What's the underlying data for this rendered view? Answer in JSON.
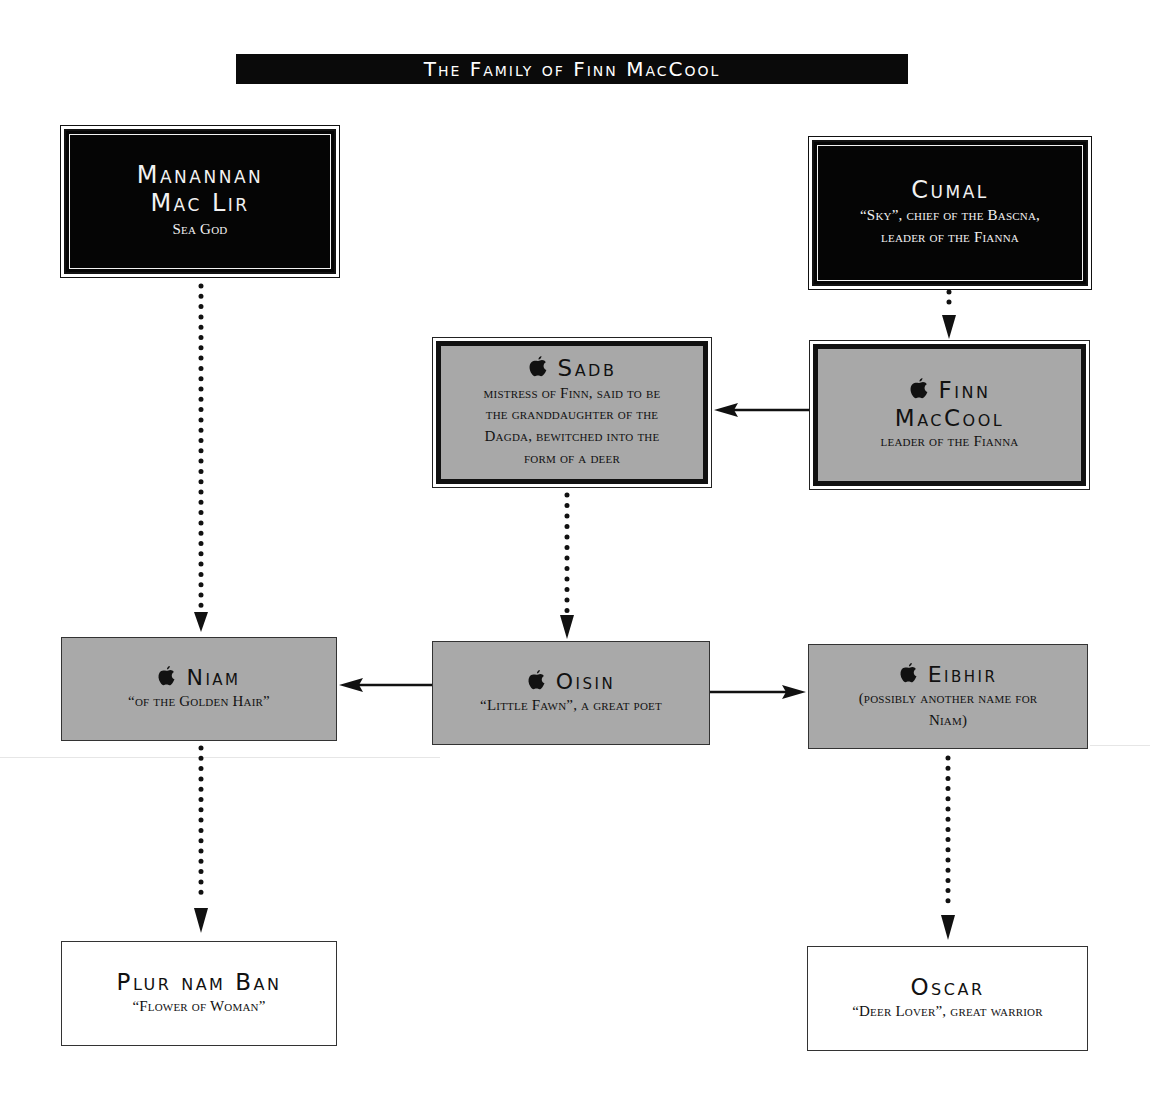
{
  "title": "The Family of Finn MacCool",
  "legend": {
    "divine_icon": "apple-icon",
    "arrow_types": [
      "dotted-arrow: descent",
      "solid-arrow: relationship"
    ]
  },
  "nodes": {
    "manannan": {
      "name_line1": "Manannan",
      "name_line2": "Mac Lir",
      "desc": "Sea God",
      "style": "black"
    },
    "cumal": {
      "name": "Cumal",
      "desc_line1": "“Sky”, chief of the Bascna,",
      "desc_line2": "leader of the Fianna",
      "style": "black"
    },
    "sadb": {
      "icon": "",
      "name": "Sadb",
      "desc_line1": "mistress of Finn, said to be",
      "desc_line2": "the granddaughter of the",
      "desc_line3": "Dagda, bewitched into the",
      "desc_line4": "form of a deer",
      "style": "grey-heavy"
    },
    "finn": {
      "icon": "",
      "name_line1": "Finn",
      "name_line2": "MacCool",
      "desc": "leader of the Fianna",
      "style": "grey-heavy"
    },
    "niam": {
      "icon": "",
      "name": "Niam",
      "desc": "“of the Golden Hair”",
      "style": "grey"
    },
    "oisin": {
      "icon": "",
      "name": "Oisin",
      "desc": "“Little Fawn”, a great poet",
      "style": "grey"
    },
    "eibhir": {
      "icon": "",
      "name": "Eibhir",
      "desc_line1": "(possibly another name for",
      "desc_line2": "Niam)",
      "style": "grey"
    },
    "plur": {
      "name": "Plur nam Ban",
      "desc": "“Flower of Woman”",
      "style": "white"
    },
    "oscar": {
      "name": "Oscar",
      "desc": "“Deer Lover”, great warrior",
      "style": "white"
    }
  },
  "edges": [
    {
      "from": "manannan",
      "to": "niam",
      "type": "dotted"
    },
    {
      "from": "cumal",
      "to": "finn",
      "type": "dotted"
    },
    {
      "from": "finn",
      "to": "sadb",
      "type": "solid"
    },
    {
      "from": "sadb",
      "to": "oisin",
      "type": "dotted"
    },
    {
      "from": "oisin",
      "to": "niam",
      "type": "solid"
    },
    {
      "from": "oisin",
      "to": "eibhir",
      "type": "solid"
    },
    {
      "from": "niam",
      "to": "plur",
      "type": "dotted"
    },
    {
      "from": "eibhir",
      "to": "oscar",
      "type": "dotted"
    }
  ]
}
